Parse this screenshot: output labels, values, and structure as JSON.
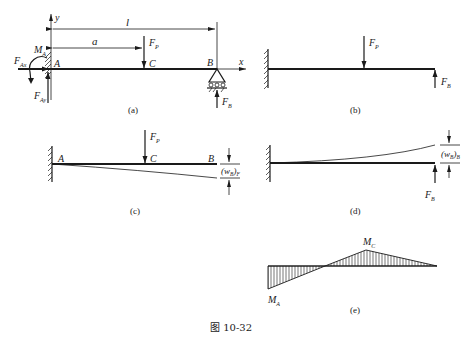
{
  "figure": {
    "caption": "图 10-32",
    "colors": {
      "ink": "#1a1a1a",
      "background": "#ffffff"
    }
  },
  "panel_a": {
    "label": "(a)",
    "axis_y": "y",
    "axis_x": "x",
    "dim_l": "l",
    "dim_a": "a",
    "point_A": "A",
    "point_B": "B",
    "point_C": "C",
    "force_P": "F",
    "force_P_sub": "P",
    "moment_A": "M",
    "moment_A_sub": "A",
    "force_Ax": "F",
    "force_Ax_sub": "Ax",
    "force_Ay": "F",
    "force_Ay_sub": "Ay",
    "force_B": "F",
    "force_B_sub": "B"
  },
  "panel_b": {
    "label": "(b)",
    "force_P": "F",
    "force_P_sub": "P",
    "force_B": "F",
    "force_B_sub": "B"
  },
  "panel_c": {
    "label": "(c)",
    "point_A": "A",
    "point_B": "B",
    "point_C": "C",
    "force_P": "F",
    "force_P_sub": "P",
    "deflection": "(w",
    "deflection_sub": "B",
    "deflection_close": ")",
    "deflection_sub2": "F"
  },
  "panel_d": {
    "label": "(d)",
    "force_B": "F",
    "force_B_sub": "B",
    "deflection": "(w",
    "deflection_sub": "B",
    "deflection_close": ")",
    "deflection_sub2": "B"
  },
  "panel_e": {
    "label": "(e)",
    "moment_C": "M",
    "moment_C_sub": "C",
    "moment_A": "M",
    "moment_A_sub": "A"
  }
}
